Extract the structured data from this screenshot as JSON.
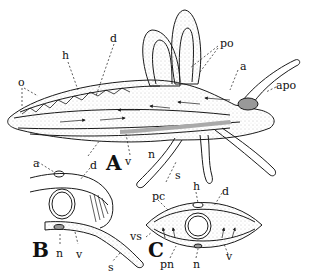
{
  "figure": {
    "panels": [
      {
        "id": "A",
        "label": "A"
      },
      {
        "id": "B",
        "label": "B"
      },
      {
        "id": "C",
        "label": "C"
      }
    ],
    "panel_A_labels": {
      "o": "o",
      "h": "h",
      "d": "d",
      "po": "po",
      "a": "a",
      "apo": "apo",
      "n": "n",
      "v": "v",
      "s": "s"
    },
    "panel_B_labels": {
      "a": "a",
      "d": "d",
      "n": "n",
      "v": "v",
      "s": "s"
    },
    "panel_C_labels": {
      "h": "h",
      "pc": "pc",
      "d": "d",
      "vs": "vs",
      "pn": "pn",
      "n": "n",
      "v": "v"
    },
    "colors": {
      "ink": "#1a1a1a",
      "stipple": "#9a9a9a",
      "background": "#ffffff"
    }
  }
}
